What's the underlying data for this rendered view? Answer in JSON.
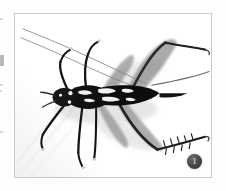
{
  "page": {
    "background_color": "#fefefe",
    "margin_marks": [
      "—",
      "‖",
      "·",
      "·",
      "·"
    ]
  },
  "figure": {
    "frame_border_color": "#c9c9c9",
    "photo_background_color": "#ffffff",
    "caption_number": "1",
    "badge_color": "#3a3a3a",
    "badge_text_color": "#f2f2f2",
    "specimen": {
      "body_color": "#111111",
      "marking_color": "#f4f4f4",
      "shadow_color": "#d8d8d8",
      "orientation": "dorsal",
      "parts": [
        "antenna-left-upper",
        "antenna-left-lower",
        "antenna-right",
        "head",
        "pronotum",
        "abdomen",
        "foreleg-left",
        "foreleg-right",
        "midleg-left",
        "midleg-right",
        "hindleg-upper-femur",
        "hindleg-upper-tibia",
        "hindleg-lower-femur",
        "hindleg-lower-tibia",
        "cercus"
      ]
    }
  }
}
